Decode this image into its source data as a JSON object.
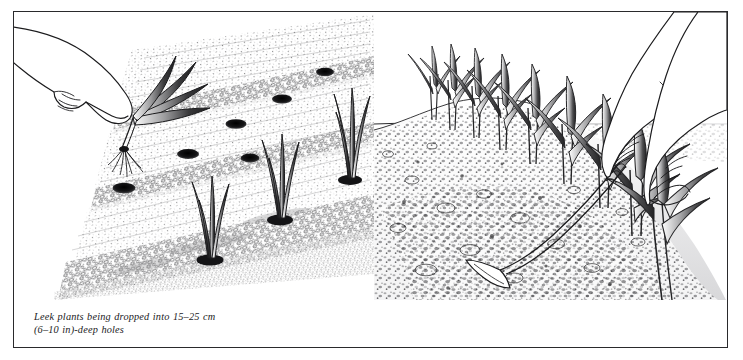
{
  "plate": {
    "border_color": "#2a2a2c",
    "background_color": "#ffffff",
    "ink_color": "#1a1a1a",
    "medium": "pen-and-ink line drawing with stipple shading"
  },
  "panels": [
    {
      "id": "left",
      "subject": "Leek plants being dropped into deep dibber holes",
      "caption": "Leek plants being dropped into 15–25 cm\n(6–10 in)-deep holes",
      "caption_line_1": "Leek plants being dropped into 15–25 cm",
      "caption_line_2": "(6–10 in)-deep holes",
      "scene": {
        "view": "raised oblique view of a seedbed with diagonal furrows",
        "hand_label": "hand holding leek seedling",
        "seedling_label": "leek seedling with trimmed roots",
        "holes_label": "dibber holes",
        "hole_count": 6,
        "planted_leek_count": 3,
        "furrow_count": 3,
        "depth_metric": "15–25 cm",
        "depth_imperial": "6–10 in"
      }
    },
    {
      "id": "right",
      "subject": "Soil drawn up around growing leeks to blanch the stems",
      "caption": "Soil drawn up around the plants helps\nto blanch the stems",
      "caption_line_1": "Soil drawn up around the plants helps",
      "caption_line_2": "to blanch the stems",
      "scene": {
        "view": "low oblique view along a ridged row of growing leeks",
        "hands_label": "two hands, one on the draw hoe handle, one steadying a leek",
        "tool_label": "draw hoe",
        "ridge_label": "soil ridge drawn up around the stems",
        "leek_count": 9,
        "horizon_label": "horizon line"
      }
    }
  ]
}
